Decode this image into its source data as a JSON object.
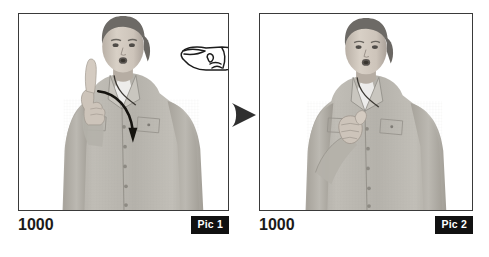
{
  "page": {
    "background_color": "#ffffff",
    "width": 489,
    "height": 257,
    "type": "sign-language-instruction-figure"
  },
  "transition": {
    "arrow_name": "sequence-arrow",
    "direction": "right",
    "color": "#2f2f2f"
  },
  "panels": [
    {
      "id": "pic1",
      "frame_number": "1000",
      "badge_label": "Pic 1",
      "badge_bg": "#111111",
      "badge_fg": "#ffffff",
      "border_color": "#3a3a3a",
      "photo": {
        "alt": "Grayscale photo of a woman in a light gray button-up shirt with hair pulled back, mouth open, right hand raised beside her face with index finger extended upward",
        "handshape_icon": "pointing-index-finger-hand",
        "motion_arrow": "curved-downward-motion-arrow",
        "skin_tone": "#cfc6bd",
        "shirt_tone": "#b8b5ae",
        "hair_tone": "#6d6a66",
        "background_tone": "#ffffff"
      }
    },
    {
      "id": "pic2",
      "frame_number": "1000",
      "badge_label": "Pic 2",
      "badge_bg": "#111111",
      "badge_fg": "#ffffff",
      "border_color": "#3a3a3a",
      "photo": {
        "alt": "Grayscale photo of the same woman with her right hand lowered to chest level, closed into a fist with thumb up",
        "handshape_icon": "thumbs-up-fist-hand",
        "motion_arrow": "none",
        "skin_tone": "#cfc6bd",
        "shirt_tone": "#b8b5ae",
        "hair_tone": "#6d6a66",
        "background_tone": "#ffffff"
      }
    }
  ]
}
